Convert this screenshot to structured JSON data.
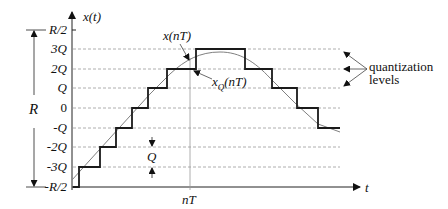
{
  "diagram": {
    "y_axis_label": "x(t)",
    "x_axis_label": "t",
    "range_label": "R",
    "step_label": "Q",
    "sample_time_label": "nT",
    "y_levels": [
      {
        "label": "R/2",
        "y": 30
      },
      {
        "label": "3Q",
        "y": 49
      },
      {
        "label": "2Q",
        "y": 69
      },
      {
        "label": "Q",
        "y": 88
      },
      {
        "label": "0",
        "y": 108
      },
      {
        "label": "-Q",
        "y": 128
      },
      {
        "label": "-2Q",
        "y": 147
      },
      {
        "label": "-3Q",
        "y": 167
      },
      {
        "label": "-R/2",
        "y": 187
      }
    ],
    "annotations": {
      "analog_signal": "x(nT)",
      "quantized_signal_base": "x",
      "quantized_signal_sub": "Q",
      "quantized_signal_tail": "(nT)",
      "quantization_levels_line1": "quantization",
      "quantization_levels_line2": "levels"
    },
    "colors": {
      "staircase": "#1a1a1a",
      "signal": "#808080",
      "grid": "#9a9a9a",
      "axis": "#222222"
    }
  }
}
